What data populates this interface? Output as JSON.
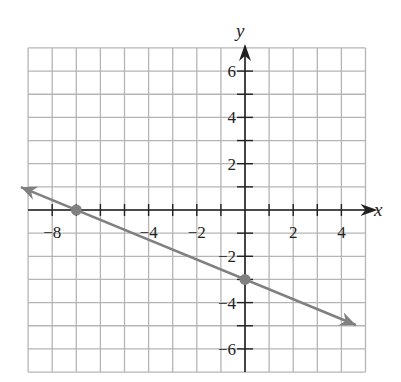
{
  "chart_data": {
    "type": "line",
    "title": "",
    "xlabel": "x",
    "ylabel": "y",
    "xlim": [
      -9,
      5
    ],
    "ylim": [
      -7,
      7
    ],
    "grid": true,
    "x_tick_labels": [
      "-8",
      "-4",
      "-2",
      "2",
      "4"
    ],
    "y_tick_labels": [
      "6",
      "4",
      "2",
      "-2",
      "-4",
      "-6"
    ],
    "series": [
      {
        "name": "line",
        "equation": "y = -3/7 x - 3",
        "slope": -0.4286,
        "intercept": -3,
        "color": "#808080",
        "arrows": "both",
        "x": [
          -9.3,
          4.6
        ],
        "y": [
          0.99,
          -4.97
        ]
      }
    ],
    "points": [
      {
        "x": -7,
        "y": 0,
        "color": "#808080"
      },
      {
        "x": 0,
        "y": -3,
        "color": "#808080"
      }
    ]
  },
  "labels": {
    "x_axis": "x",
    "y_axis": "y"
  }
}
